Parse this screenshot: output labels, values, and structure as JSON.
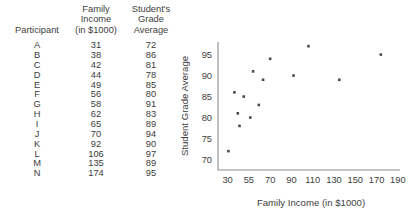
{
  "table": {
    "name": "participant-data-table",
    "headers": {
      "participant": [
        "Participant"
      ],
      "income": [
        "Family",
        "Income",
        "(in $1000)"
      ],
      "grade": [
        "Student's",
        "Grade",
        "Average"
      ]
    },
    "rows": [
      {
        "participant": "A",
        "income": "31",
        "grade": "72"
      },
      {
        "participant": "B",
        "income": "38",
        "grade": "86"
      },
      {
        "participant": "C",
        "income": "42",
        "grade": "81"
      },
      {
        "participant": "D",
        "income": "44",
        "grade": "78"
      },
      {
        "participant": "E",
        "income": "49",
        "grade": "85"
      },
      {
        "participant": "F",
        "income": "56",
        "grade": "80"
      },
      {
        "participant": "G",
        "income": "58",
        "grade": "91"
      },
      {
        "participant": "H",
        "income": "62",
        "grade": "83"
      },
      {
        "participant": "I",
        "income": "65",
        "grade": "89"
      },
      {
        "participant": "J",
        "income": "70",
        "grade": "94"
      },
      {
        "participant": "K",
        "income": "92",
        "grade": "90"
      },
      {
        "participant": "L",
        "income": "106",
        "grade": "97"
      },
      {
        "participant": "M",
        "income": "135",
        "grade": "89"
      },
      {
        "participant": "N",
        "income": "174",
        "grade": "95"
      }
    ]
  },
  "chart_data": {
    "type": "scatter",
    "title": "",
    "xlabel": "Family Income (in $1000)",
    "ylabel": "Student Grade Average",
    "xticklabels": [
      "30",
      "55",
      "70",
      "90",
      "110",
      "130",
      "150",
      "170",
      "190"
    ],
    "xtickvalues": [
      30,
      55,
      70,
      90,
      110,
      130,
      150,
      170,
      190
    ],
    "yticklabels": [
      "70",
      "75",
      "80",
      "85",
      "90",
      "95"
    ],
    "ytickvalues": [
      70,
      75,
      80,
      85,
      90,
      95
    ],
    "xlim": [
      22,
      198
    ],
    "ylim": [
      67.5,
      98
    ],
    "grid": false,
    "legend": null,
    "marker_color": "#4a4a4a",
    "axis_color": "#8c8c8c",
    "points": [
      {
        "label": "A",
        "x": 31,
        "y": 72
      },
      {
        "label": "B",
        "x": 38,
        "y": 86
      },
      {
        "label": "C",
        "x": 42,
        "y": 81
      },
      {
        "label": "D",
        "x": 44,
        "y": 78
      },
      {
        "label": "E",
        "x": 49,
        "y": 85
      },
      {
        "label": "F",
        "x": 56,
        "y": 80
      },
      {
        "label": "G",
        "x": 58,
        "y": 91
      },
      {
        "label": "H",
        "x": 62,
        "y": 83
      },
      {
        "label": "I",
        "x": 65,
        "y": 89
      },
      {
        "label": "J",
        "x": 70,
        "y": 94
      },
      {
        "label": "K",
        "x": 92,
        "y": 90
      },
      {
        "label": "L",
        "x": 106,
        "y": 97
      },
      {
        "label": "M",
        "x": 135,
        "y": 89
      },
      {
        "label": "N",
        "x": 174,
        "y": 95
      }
    ]
  }
}
